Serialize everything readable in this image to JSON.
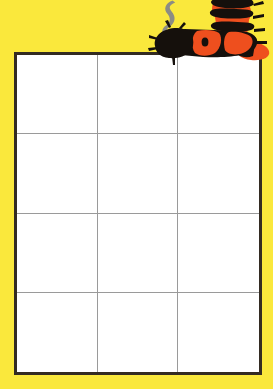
{
  "page": {
    "background_color": "#FAE83C"
  },
  "grid": {
    "name": "worksheet-grid",
    "columns": 3,
    "rows": 4,
    "border_color": "#332B22",
    "cell_line_color": "#9A9A9A",
    "cell_fill_color": "#FFFFFF",
    "cells": [
      {
        "row": 1,
        "col": 1,
        "text": ""
      },
      {
        "row": 1,
        "col": 2,
        "text": ""
      },
      {
        "row": 1,
        "col": 3,
        "text": ""
      },
      {
        "row": 2,
        "col": 1,
        "text": ""
      },
      {
        "row": 2,
        "col": 2,
        "text": ""
      },
      {
        "row": 2,
        "col": 3,
        "text": ""
      },
      {
        "row": 3,
        "col": 1,
        "text": ""
      },
      {
        "row": 3,
        "col": 2,
        "text": ""
      },
      {
        "row": 3,
        "col": 3,
        "text": ""
      },
      {
        "row": 4,
        "col": 1,
        "text": ""
      },
      {
        "row": 4,
        "col": 2,
        "text": ""
      },
      {
        "row": 4,
        "col": 3,
        "text": ""
      }
    ]
  },
  "illustration": {
    "caterpillar": {
      "name": "caterpillar-illustration",
      "body_color": "#15100C",
      "stripe_color": "#EE4F1E",
      "outline_color": "#15100C"
    },
    "smoke": {
      "name": "smoke-wisp-illustration",
      "color": "#8C8C84"
    }
  }
}
